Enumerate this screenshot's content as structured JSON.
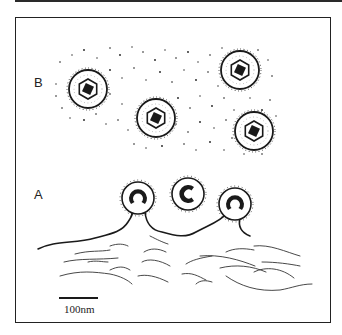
{
  "figure": {
    "panel_labels": {
      "b": "B",
      "a": "A"
    },
    "scale_bar": {
      "label": "100nm"
    },
    "panel_b": {
      "description": "Free particles with hexagonal core and dense central nucleoid, surrounded by fringe and scattered dots",
      "particles": [
        {
          "cx": 88,
          "cy": 89
        },
        {
          "cx": 156,
          "cy": 118
        },
        {
          "cx": 240,
          "cy": 70
        },
        {
          "cx": 254,
          "cy": 131
        }
      ]
    },
    "panel_a": {
      "description": "Budding particles with C-shaped nucleoid emerging from membrane above fibrous layer",
      "buds": [
        {
          "cx": 138,
          "cy": 200
        },
        {
          "cx": 188,
          "cy": 194
        },
        {
          "cx": 235,
          "cy": 204
        }
      ]
    },
    "colors": {
      "ink": "#1a1a1a",
      "paper": "#ffffff"
    }
  }
}
